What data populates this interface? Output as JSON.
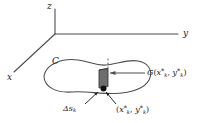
{
  "figure": {
    "type": "vector-diagram",
    "background_color": "#ffffff",
    "stroke_color": "#4d4d4d",
    "text_color": "#1a1a1a",
    "strip_fill_color": "#6e6e6e",
    "strip_edge_color": "#3a3a3a"
  },
  "axes": {
    "z": {
      "label": "z",
      "direction": "up"
    },
    "y": {
      "label": "y",
      "direction": "right"
    },
    "x": {
      "label": "x",
      "direction": "lower-left"
    },
    "origin": {
      "x": 55,
      "y": 34
    }
  },
  "curve": {
    "label": "C",
    "name": "closed-curve"
  },
  "annotations": {
    "g_label": {
      "base": "G",
      "open_paren": "(",
      "var1": "x",
      "var1_star": "*",
      "var1_sub": "k",
      "comma": ", ",
      "var2": "y",
      "var2_star": "*",
      "var2_sub": "k",
      "close_paren": ")"
    },
    "delta_s_label": {
      "base": "Δs",
      "sub": "k"
    },
    "point_label": {
      "open_paren": "(",
      "var1": "x",
      "var1_star": "*",
      "var1_sub": "k",
      "comma": ", ",
      "var2": "y",
      "var2_star": "*",
      "var2_sub": "k",
      "close_paren": ")"
    }
  }
}
